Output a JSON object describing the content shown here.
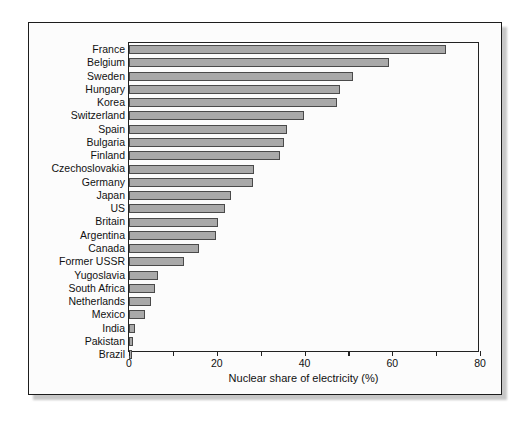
{
  "chart_data": {
    "type": "bar",
    "orientation": "horizontal",
    "title": "",
    "xlabel": "Nuclear share of electricity (%)",
    "ylabel": "",
    "xlim": [
      0,
      80
    ],
    "xticks": [
      0,
      20,
      40,
      60,
      80
    ],
    "xtick_labels": [
      "0",
      "20",
      "40",
      "60",
      "80"
    ],
    "minor_xticks": [
      10,
      30,
      50,
      70
    ],
    "grid": false,
    "legend": null,
    "bar_color": "#a9a9a9",
    "bar_edge_color": "#4a4a4a",
    "categories": [
      "France",
      "Belgium",
      "Sweden",
      "Hungary",
      "Korea",
      "Switzerland",
      "Spain",
      "Bulgaria",
      "Finland",
      "Czechoslovakia",
      "Germany",
      "Japan",
      "US",
      "Britain",
      "Argentina",
      "Canada",
      "Former USSR",
      "Yugoslavia",
      "South Africa",
      "Netherlands",
      "Mexico",
      "India",
      "Pakistan",
      "Brazil"
    ],
    "values": [
      72.2,
      59.2,
      51.0,
      48.0,
      47.5,
      39.8,
      36.0,
      35.3,
      34.4,
      28.5,
      28.2,
      23.2,
      21.9,
      20.3,
      19.8,
      16.0,
      12.5,
      6.6,
      6.0,
      5.0,
      3.6,
      1.4,
      0.8,
      0.6
    ]
  }
}
